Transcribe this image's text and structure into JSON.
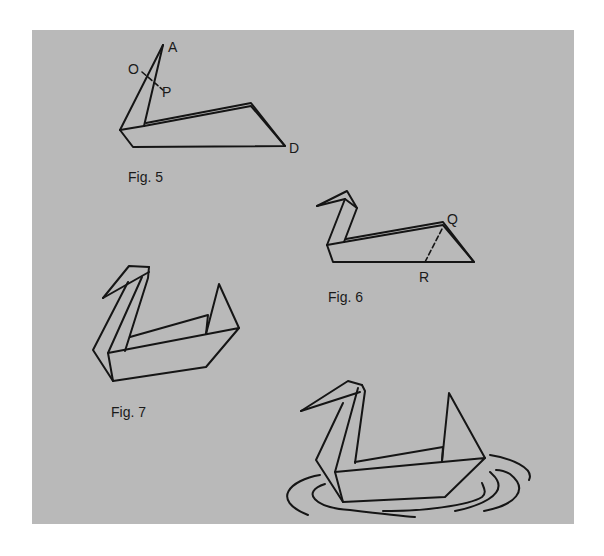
{
  "page": {
    "background": "#ffffff",
    "panel_color": "#b9b9b9",
    "line_color": "#151515"
  },
  "figures": [
    {
      "id": "fig5",
      "caption": "Fig. 5",
      "caption_pos": [
        128,
        182
      ],
      "points": [
        {
          "label": "A",
          "pos": [
            168,
            52
          ]
        },
        {
          "label": "O",
          "pos": [
            128,
            74
          ]
        },
        {
          "label": "P",
          "pos": [
            162,
            97
          ]
        },
        {
          "label": "D",
          "pos": [
            289,
            153
          ]
        }
      ],
      "lines": [
        [
          [
            120,
            130
          ],
          [
            163,
            45
          ]
        ],
        [
          [
            144,
            126
          ],
          [
            163,
            45
          ]
        ],
        [
          [
            120,
            130
          ],
          [
            133,
            147
          ],
          [
            285,
            146
          ],
          [
            251,
            106
          ],
          [
            144,
            126
          ]
        ],
        [
          [
            120,
            130
          ],
          [
            144,
            126
          ]
        ],
        [
          [
            146,
            123
          ],
          [
            251,
            103
          ],
          [
            285,
            146
          ]
        ]
      ],
      "dashed": [
        [
          [
            142,
            72
          ],
          [
            163,
            90
          ]
        ]
      ]
    },
    {
      "id": "fig6",
      "caption": "Fig. 6",
      "caption_pos": [
        328,
        302
      ],
      "points": [
        {
          "label": "Q",
          "pos": [
            447,
            224
          ]
        },
        {
          "label": "R",
          "pos": [
            419,
            282
          ]
        }
      ],
      "lines": [
        [
          [
            317,
            206
          ],
          [
            347,
            191
          ],
          [
            357,
            208
          ],
          [
            344,
            242
          ]
        ],
        [
          [
            317,
            206
          ],
          [
            345,
            199
          ],
          [
            357,
            208
          ]
        ],
        [
          [
            345,
            199
          ],
          [
            327,
            245
          ]
        ],
        [
          [
            327,
            245
          ],
          [
            333,
            262
          ],
          [
            474,
            262
          ],
          [
            443,
            225
          ],
          [
            344,
            242
          ]
        ],
        [
          [
            327,
            245
          ],
          [
            344,
            242
          ]
        ],
        [
          [
            346,
            239
          ],
          [
            443,
            222
          ],
          [
            474,
            262
          ]
        ]
      ],
      "dashed": [
        [
          [
            425,
            262
          ],
          [
            443,
            227
          ]
        ]
      ]
    },
    {
      "id": "fig7",
      "caption": "Fig. 7",
      "caption_pos": [
        111,
        417
      ],
      "points": [],
      "lines": [
        [
          [
            103,
            298
          ],
          [
            129,
            266
          ],
          [
            149,
            267
          ]
        ],
        [
          [
            103,
            298
          ],
          [
            149,
            272
          ]
        ],
        [
          [
            149,
            267
          ],
          [
            148,
            278
          ],
          [
            125,
            351
          ]
        ],
        [
          [
            128,
            282
          ],
          [
            93,
            350
          ],
          [
            113,
            381
          ]
        ],
        [
          [
            108,
            353
          ],
          [
            113,
            381
          ],
          [
            206,
            367
          ],
          [
            239,
            328
          ],
          [
            108,
            353
          ]
        ],
        [
          [
            130,
            337
          ],
          [
            208,
            315
          ],
          [
            206,
            334
          ]
        ],
        [
          [
            206,
            334
          ],
          [
            219,
            284
          ],
          [
            239,
            328
          ]
        ],
        [
          [
            142,
            277
          ],
          [
            108,
            353
          ]
        ]
      ],
      "dashed": []
    },
    {
      "id": "fig8",
      "caption": "",
      "caption_pos": [
        0,
        0
      ],
      "points": [],
      "lines": [
        [
          [
            301,
            411
          ],
          [
            348,
            381
          ],
          [
            362,
            385
          ]
        ],
        [
          [
            301,
            411
          ],
          [
            360,
            392
          ]
        ],
        [
          [
            362,
            385
          ],
          [
            365,
            391
          ],
          [
            355,
            463
          ]
        ],
        [
          [
            343,
            403
          ],
          [
            316,
            460
          ],
          [
            343,
            502
          ]
        ],
        [
          [
            358,
            388
          ],
          [
            335,
            472
          ]
        ],
        [
          [
            335,
            472
          ],
          [
            343,
            502
          ],
          [
            445,
            497
          ],
          [
            485,
            458
          ],
          [
            335,
            472
          ]
        ],
        [
          [
            355,
            462
          ],
          [
            443,
            447
          ],
          [
            442,
            461
          ]
        ],
        [
          [
            442,
            461
          ],
          [
            449,
            393
          ],
          [
            485,
            458
          ]
        ]
      ],
      "curves": [
        "M 320 475 C 290 480, 270 500, 308 515",
        "M 325 484 C 300 492, 315 508, 350 510 C 375 513, 400 516, 415 517",
        "M 383 511 C 420 512, 470 505, 482 497 C 487 493, 484 488, 482 483",
        "M 455 511 C 480 506, 505 495, 497 480 C 495 476, 492 474, 490 472",
        "M 484 511 C 515 505, 530 490, 510 474 C 505 471, 500 470, 496 470",
        "M 490 455 C 510 458, 535 468, 529 480"
      ],
      "dashed": []
    }
  ]
}
